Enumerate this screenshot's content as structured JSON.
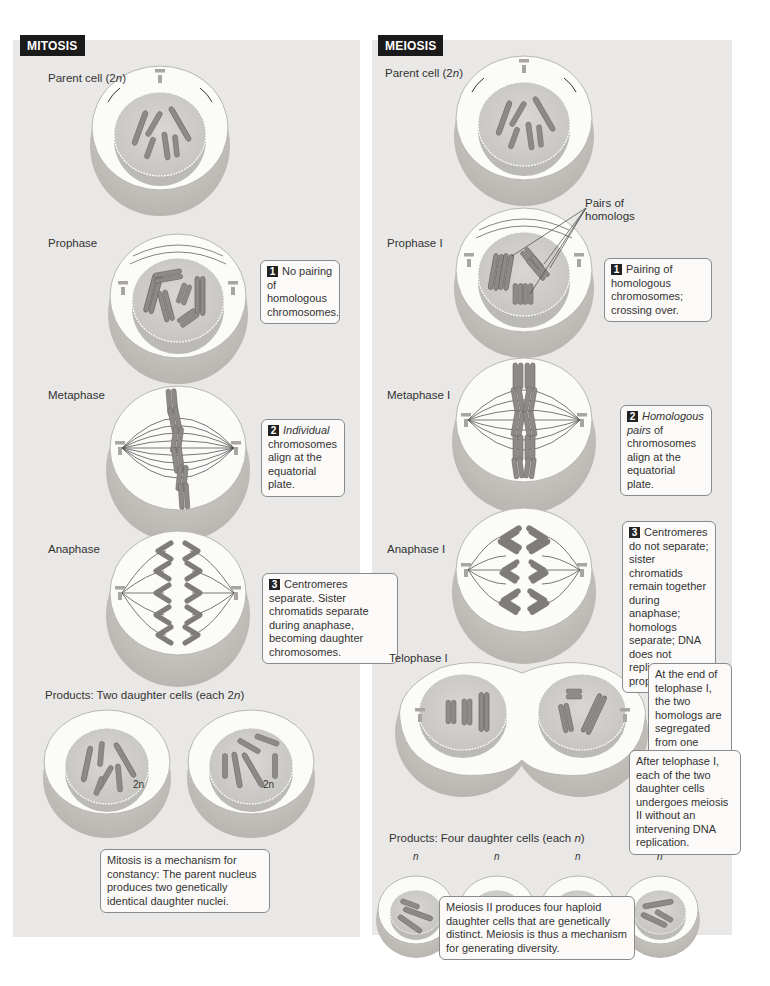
{
  "figure": {
    "colors": {
      "panel_bg": "#e9e8e6",
      "cell_shadow": "#c8c6c2",
      "cytoplasm": "#fafaf8",
      "nucleus": "#d2d0cc",
      "chromosome": "#8a8784",
      "tag_bg": "#1a1a1a"
    }
  },
  "mitosis": {
    "tag": "MITOSIS",
    "stages": [
      {
        "label": "Parent cell (2",
        "label_italic": "n",
        "label_end": ")"
      },
      {
        "label": "Prophase",
        "note_num": "1",
        "note": "No pairing of homologous chromosomes."
      },
      {
        "label": "Metaphase",
        "note_num": "2",
        "note_italic": "Individual",
        "note": "chromosomes align at the equatorial plate."
      },
      {
        "label": "Anaphase",
        "note_num": "3",
        "note": "Centromeres separate. Sister chromatids separate during anaphase, becoming daughter chromosomes."
      }
    ],
    "products": {
      "label": "Products: Two daughter cells (each 2",
      "label_italic": "n",
      "label_end": ")",
      "cell_tag": "2n"
    },
    "summary": "Mitosis is a mechanism for constancy: The parent nucleus produces two genetically identical daughter nuclei."
  },
  "meiosis": {
    "tag": "MEIOSIS",
    "stages": [
      {
        "label": "Parent cell (2",
        "label_italic": "n",
        "label_end": ")"
      },
      {
        "label": "Prophase I",
        "callout": "Pairs of homologs",
        "note_num": "1",
        "note": "Pairing of homologous chromosomes; crossing over."
      },
      {
        "label": "Metaphase I",
        "note_num": "2",
        "note_italic": "Homologous pairs",
        "note": "of chromosomes align at the equatorial plate."
      },
      {
        "label": "Anaphase I",
        "note_num": "3",
        "note": "Centromeres do not separate; sister chromatids remain together during anaphase; homologs separate; DNA does not replicate before prophase II."
      },
      {
        "label": "Telophase I",
        "note": "At the end of telophase I, the two homologs are segregated from one another."
      }
    ],
    "after_telophase_note": "After telophase I, each of the two daughter cells undergoes meiosis II without an intervening DNA replication.",
    "products": {
      "label": "Products: Four daughter cells (each ",
      "label_italic": "n",
      "label_end": ")",
      "cell_tags": [
        "n",
        "n",
        "n",
        "n"
      ]
    },
    "summary": "Meiosis II produces four haploid daughter cells that are genetically distinct. Meiosis is thus a mechanism for generating diversity."
  }
}
